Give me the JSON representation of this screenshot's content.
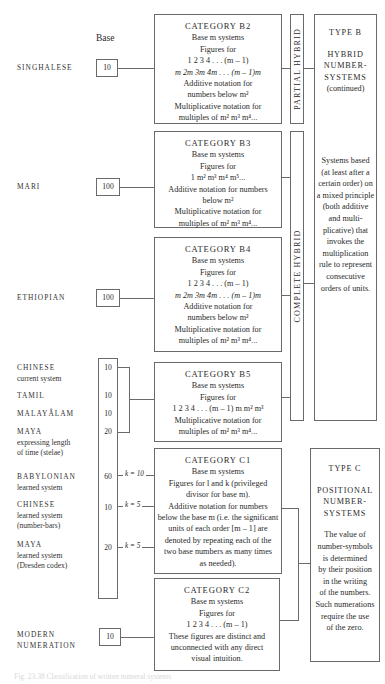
{
  "header": {
    "base_label": "Base"
  },
  "systems": [
    {
      "name": "SINGHALESE",
      "sub": "",
      "base": "10"
    },
    {
      "name": "MARI",
      "sub": "",
      "base": "100"
    },
    {
      "name": "ETHIOPIAN",
      "sub": "",
      "base": "100"
    },
    {
      "name": "CHINESE",
      "sub": "current system",
      "base": "10"
    },
    {
      "name": "TAMIL",
      "sub": "",
      "base": "10"
    },
    {
      "name": "MALAYÂLAM",
      "sub": "",
      "base": "10"
    },
    {
      "name": "MAYA",
      "sub": "expressing length",
      "sub2": "of time (stelae)",
      "base": "20"
    },
    {
      "name": "BABYLONIAN",
      "sub": "learned system",
      "base": "60",
      "k": "k = 10"
    },
    {
      "name": "CHINESE",
      "sub": "learned system",
      "sub2": "(number-bars)",
      "base": "10",
      "k": "k = 5"
    },
    {
      "name": "MAYA",
      "sub": "learned system",
      "sub2": "(Dresden codex)",
      "base": "20",
      "k": "k = 5"
    },
    {
      "name": "MODERN",
      "sub2": "NUMERATION",
      "base": "10"
    }
  ],
  "categories": {
    "b2": {
      "title": "CATEGORY B2",
      "lines": [
        "Base m systems",
        "Figures for",
        "1   2   3   4 . . . (m – 1)",
        "m  2m  3m  4m . . . (m – 1)m",
        "Additive notation for",
        "numbers below m²",
        "Multiplicative notation for",
        "multiples of m² m³ m⁴..."
      ]
    },
    "b3": {
      "title": "CATEGORY B3",
      "lines": [
        "Base m systems",
        "Figures for",
        "1 m² m³ m⁴ m⁵...",
        "Additive notation for numbers",
        "below m²",
        "Multiplicative notation for",
        "multiples of m² m³ m⁴..."
      ]
    },
    "b4": {
      "title": "CATEGORY B4",
      "lines": [
        "Base m systems",
        "Figures for",
        "1   2   3   4 . . . (m – 1)",
        "m  2m  3m  4m . . . (m – 1)m",
        "Additive notation for",
        "numbers below m²",
        "Multiplicative notation for",
        "multiples of m² m³ m⁴..."
      ]
    },
    "b5": {
      "title": "CATEGORY B5",
      "lines": [
        "Base m systems",
        "Figures for",
        "1   2   3   4 . . . (m – 1) m  m² m³",
        "Multiplicative notation for",
        "multiples of m² m³ m⁴..."
      ]
    },
    "c1": {
      "title": "CATEGORY C1",
      "lines": [
        "Base m systems",
        "Figures for l and k (privileged",
        "divisor for base m).",
        "Additive notation for numbers",
        "below the base m (i.e. the significant",
        "units of each order [m – 1] are",
        "denoted by repeating each of the",
        "two base numbers as many times",
        "as needed)."
      ]
    },
    "c2": {
      "title": "CATEGORY C2",
      "lines": [
        "Base m systems",
        "Figures for",
        "1 2 3 4 . . . (m – 1)",
        "These figures are distinct and",
        "unconnected with any direct",
        "visual intuition."
      ]
    }
  },
  "brackets": {
    "partial": "PARTIAL HYBRID",
    "complete": "COMPLETE HYBRID"
  },
  "types": {
    "b": {
      "title": "TYPE B",
      "heading": [
        "HYBRID",
        "NUMBER-",
        "SYSTEMS",
        "(continued)"
      ],
      "desc": [
        "Systems based",
        "(at least after a",
        "certain order) on",
        "a mixed principle",
        "(both additive",
        "and multi-",
        "plicative) that",
        "invokes the",
        "multiplication",
        "rule to represent",
        "consecutive",
        "orders of units."
      ]
    },
    "c": {
      "title": "TYPE C",
      "heading": [
        "POSITIONAL",
        "NUMBER-",
        "SYSTEMS"
      ],
      "desc": [
        "The value of",
        "number-symbols",
        "is determined",
        "by their position",
        "in the writing",
        "of the numbers.",
        "Such numerations",
        "require the use",
        "of the zero."
      ]
    }
  },
  "caption": "Fig. 23.38 Classification of written numeral systems"
}
